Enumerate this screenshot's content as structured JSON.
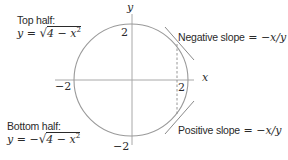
{
  "diagram": {
    "type": "circle-implicit-differentiation",
    "circle": {
      "equation_radius": 2,
      "center": [
        0,
        0
      ]
    },
    "axes": {
      "x_label": "x",
      "y_label": "y",
      "tick_labels": {
        "x_pos": "2",
        "x_neg": "−2",
        "y_pos": "2",
        "y_neg": "−2"
      }
    },
    "annotations": {
      "top_half": {
        "title": "Top half:",
        "eq_lhs": "y = ",
        "eq_rad": "4 − x",
        "eq_exp": "2"
      },
      "bottom_half": {
        "title": "Bottom half:",
        "eq_lhs": "y = −",
        "eq_rad": "4 − x",
        "eq_exp": "2"
      },
      "negative_slope": {
        "text": "Negative slope",
        "eq": " = −x/y"
      },
      "positive_slope": {
        "text": "Positive slope",
        "eq": " = −x/y"
      }
    },
    "colors": {
      "circle": "#9a9a9a",
      "axes": "#a8a8a8",
      "tangent": "#8a8a8a",
      "dashed": "#8a8a8a",
      "text": "#2a2a2a"
    }
  }
}
